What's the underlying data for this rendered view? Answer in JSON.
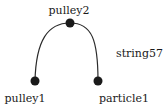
{
  "diagram": {
    "nodes": [
      {
        "id": "pulley2",
        "label": "pulley2",
        "x": 70,
        "y": 23
      },
      {
        "id": "pulley1",
        "label": "pulley1",
        "x": 35,
        "y": 81
      },
      {
        "id": "particle1",
        "label": "particle1",
        "x": 98,
        "y": 81
      }
    ],
    "edges": [
      {
        "id": "string57",
        "label": "string57",
        "path": [
          "pulley1",
          "pulley2",
          "particle1"
        ]
      }
    ],
    "colors": {
      "node": "#1a1a1a",
      "edge": "#2a2a2a",
      "text": "#1a1a1a"
    }
  }
}
